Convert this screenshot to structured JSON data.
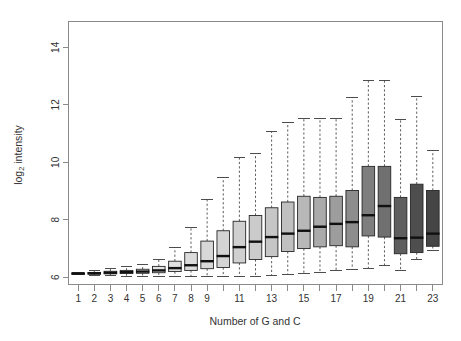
{
  "chart_data": {
    "type": "box",
    "title": "",
    "xlabel": "Number of G and C",
    "ylabel": "log2 intensity",
    "ylabel_parts": {
      "base": "log",
      "sub": "2",
      "rest": " intensity"
    },
    "xlim": [
      0.4,
      23.6
    ],
    "ylim": [
      5.75,
      14.9
    ],
    "grid": false,
    "legend": null,
    "y_ticks": [
      6,
      8,
      10,
      12,
      14
    ],
    "y_tick_labels": [
      "6",
      "8",
      "10",
      "12",
      "14"
    ],
    "x_ticks": [
      1,
      2,
      3,
      4,
      5,
      6,
      7,
      8,
      9,
      10,
      11,
      12,
      13,
      14,
      15,
      16,
      17,
      18,
      19,
      20,
      21,
      22,
      23
    ],
    "x_tick_labels": [
      "1",
      "2",
      "3",
      "4",
      "5",
      "6",
      "7",
      "8",
      "9",
      "",
      "11",
      "",
      "13",
      "",
      "15",
      "",
      "17",
      "",
      "19",
      "",
      "21",
      "",
      "23"
    ],
    "categories": [
      1,
      2,
      3,
      4,
      5,
      6,
      7,
      8,
      9,
      10,
      11,
      12,
      13,
      14,
      15,
      16,
      17,
      18,
      19,
      20,
      21,
      22,
      23
    ],
    "boxes": [
      {
        "x": 1,
        "lower_whisker": 6.1,
        "q1": 6.11,
        "median": 6.13,
        "q3": 6.15,
        "upper_whisker": 6.17,
        "fill": "#f2f2f2"
      },
      {
        "x": 2,
        "lower_whisker": 6.08,
        "q1": 6.11,
        "median": 6.14,
        "q3": 6.17,
        "upper_whisker": 6.22,
        "fill": "#f0f0f0"
      },
      {
        "x": 3,
        "lower_whisker": 6.05,
        "q1": 6.12,
        "median": 6.16,
        "q3": 6.21,
        "upper_whisker": 6.3,
        "fill": "#ededed"
      },
      {
        "x": 4,
        "lower_whisker": 6.04,
        "q1": 6.13,
        "median": 6.18,
        "q3": 6.24,
        "upper_whisker": 6.36,
        "fill": "#eaeaea"
      },
      {
        "x": 5,
        "lower_whisker": 6.03,
        "q1": 6.14,
        "median": 6.2,
        "q3": 6.28,
        "upper_whisker": 6.44,
        "fill": "#e7e7e7"
      },
      {
        "x": 6,
        "lower_whisker": 6.02,
        "q1": 6.16,
        "median": 6.24,
        "q3": 6.38,
        "upper_whisker": 6.62,
        "fill": "#e3e3e3"
      },
      {
        "x": 7,
        "lower_whisker": 6.02,
        "q1": 6.2,
        "median": 6.32,
        "q3": 6.56,
        "upper_whisker": 7.05,
        "fill": "#e0e0e0"
      },
      {
        "x": 8,
        "lower_whisker": 6.02,
        "q1": 6.24,
        "median": 6.42,
        "q3": 6.86,
        "upper_whisker": 7.75,
        "fill": "#dcdcdc"
      },
      {
        "x": 9,
        "lower_whisker": 6.02,
        "q1": 6.3,
        "median": 6.56,
        "q3": 7.26,
        "upper_whisker": 8.7,
        "fill": "#d8d8d8"
      },
      {
        "x": 10,
        "lower_whisker": 6.02,
        "q1": 6.34,
        "median": 6.74,
        "q3": 7.62,
        "upper_whisker": 9.48,
        "fill": "#d4d4d4"
      },
      {
        "x": 11,
        "lower_whisker": 6.02,
        "q1": 6.5,
        "median": 7.05,
        "q3": 7.95,
        "upper_whisker": 10.16,
        "fill": "#d0d0d0"
      },
      {
        "x": 12,
        "lower_whisker": 6.02,
        "q1": 6.62,
        "median": 7.24,
        "q3": 8.15,
        "upper_whisker": 10.3,
        "fill": "#cbcbcb"
      },
      {
        "x": 13,
        "lower_whisker": 6.05,
        "q1": 6.72,
        "median": 7.4,
        "q3": 8.42,
        "upper_whisker": 11.06,
        "fill": "#c6c6c6"
      },
      {
        "x": 14,
        "lower_whisker": 6.1,
        "q1": 6.9,
        "median": 7.52,
        "q3": 8.62,
        "upper_whisker": 11.38,
        "fill": "#c0c0c0"
      },
      {
        "x": 15,
        "lower_whisker": 6.14,
        "q1": 7.0,
        "median": 7.62,
        "q3": 8.82,
        "upper_whisker": 11.52,
        "fill": "#b8b8b8"
      },
      {
        "x": 16,
        "lower_whisker": 6.18,
        "q1": 7.06,
        "median": 7.76,
        "q3": 8.78,
        "upper_whisker": 11.52,
        "fill": "#ababab"
      },
      {
        "x": 17,
        "lower_whisker": 6.22,
        "q1": 7.1,
        "median": 7.86,
        "q3": 8.82,
        "upper_whisker": 11.52,
        "fill": "#9d9d9d"
      },
      {
        "x": 18,
        "lower_whisker": 6.28,
        "q1": 7.06,
        "median": 7.92,
        "q3": 9.02,
        "upper_whisker": 12.26,
        "fill": "#8d8d8d"
      },
      {
        "x": 19,
        "lower_whisker": 6.32,
        "q1": 7.44,
        "median": 8.16,
        "q3": 9.86,
        "upper_whisker": 12.84,
        "fill": "#7e7e7e"
      },
      {
        "x": 20,
        "lower_whisker": 6.4,
        "q1": 7.4,
        "median": 8.48,
        "q3": 9.86,
        "upper_whisker": 12.84,
        "fill": "#707070"
      },
      {
        "x": 21,
        "lower_whisker": 6.24,
        "q1": 6.82,
        "median": 7.36,
        "q3": 8.78,
        "upper_whisker": 11.5,
        "fill": "#5e5e5e"
      },
      {
        "x": 22,
        "lower_whisker": 6.62,
        "q1": 6.86,
        "median": 7.38,
        "q3": 9.24,
        "upper_whisker": 12.3,
        "fill": "#4e4e4e"
      },
      {
        "x": 23,
        "lower_whisker": 6.92,
        "q1": 7.08,
        "median": 7.52,
        "q3": 9.02,
        "upper_whisker": 10.42,
        "fill": "#454545"
      }
    ]
  },
  "colors": {
    "axis": "#8a8a8a",
    "text": "#333333",
    "median": "#101010",
    "box_border": "#262626",
    "whisker": "#4a4a4a",
    "background": "#ffffff"
  }
}
